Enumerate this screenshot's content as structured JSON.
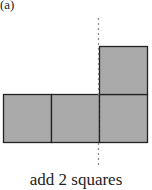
{
  "figure": {
    "label": "(a)",
    "caption": "add 2 squares",
    "colors": {
      "fill": "#aaaaaa",
      "stroke": "#222222",
      "axis": "#888888"
    },
    "squares": [
      {
        "x": 3,
        "y": 94,
        "size": 48
      },
      {
        "x": 51,
        "y": 94,
        "size": 48
      },
      {
        "x": 99,
        "y": 94,
        "size": 48
      },
      {
        "x": 99,
        "y": 46,
        "size": 48
      }
    ],
    "symmetry_line": {
      "x": 98,
      "y1": 18,
      "y2": 168,
      "style": "dotted"
    }
  }
}
